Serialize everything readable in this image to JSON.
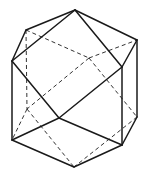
{
  "figure": {
    "vertices": {
      "T": [
        75,
        10
      ],
      "UL": [
        26,
        30
      ],
      "R": [
        137,
        40
      ],
      "L": [
        12,
        61
      ],
      "RF": [
        122,
        67
      ],
      "X": [
        89,
        58
      ],
      "Y": [
        27,
        109
      ],
      "C": [
        59,
        118
      ],
      "LR": [
        137,
        117
      ],
      "BL": [
        12,
        140
      ],
      "BR": [
        122,
        145
      ],
      "B": [
        74,
        167
      ]
    },
    "solid_edges": [
      [
        "T",
        "UL"
      ],
      [
        "T",
        "L"
      ],
      [
        "T",
        "R"
      ],
      [
        "T",
        "RF"
      ],
      [
        "UL",
        "L"
      ],
      [
        "L",
        "BL"
      ],
      [
        "L",
        "C"
      ],
      [
        "R",
        "RF"
      ],
      [
        "R",
        "LR"
      ],
      [
        "RF",
        "C"
      ],
      [
        "RF",
        "BR"
      ],
      [
        "BL",
        "C"
      ],
      [
        "C",
        "BR"
      ],
      [
        "BR",
        "LR"
      ],
      [
        "BL",
        "B"
      ],
      [
        "BR",
        "B"
      ]
    ],
    "dashed_edges": [
      [
        "UL",
        "X"
      ],
      [
        "X",
        "R"
      ],
      [
        "UL",
        "Y"
      ],
      [
        "X",
        "Y"
      ],
      [
        "X",
        "LR"
      ],
      [
        "Y",
        "BL"
      ],
      [
        "Y",
        "B"
      ],
      [
        "LR",
        "B"
      ]
    ]
  }
}
